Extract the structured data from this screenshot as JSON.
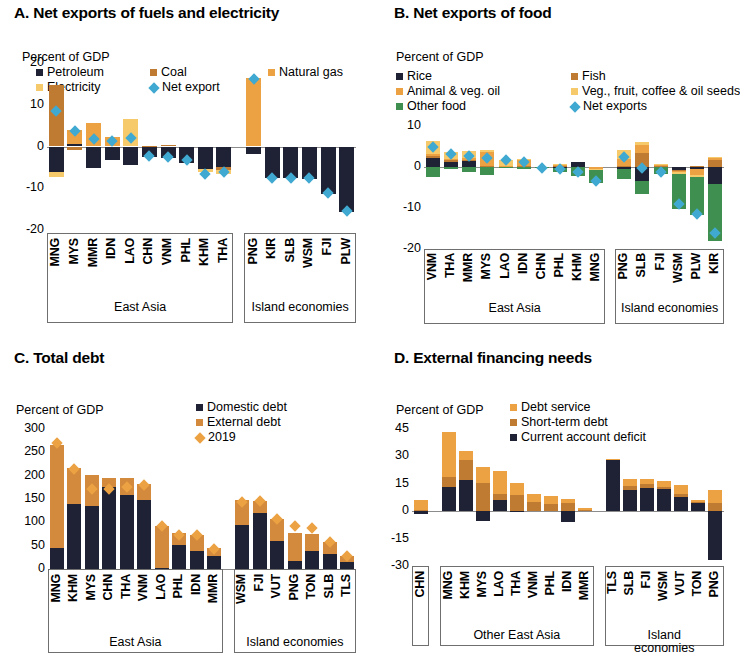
{
  "figure": {
    "background": "#ffffff",
    "colors": {
      "petroleum": "#1f2235",
      "coal": "#c07b33",
      "natural_gas": "#eca243",
      "electricity": "#f6c96a",
      "net_export": "#3fa9d1",
      "rice": "#1f2235",
      "fish": "#c07b33",
      "animal_veg_oil": "#eca243",
      "veg_fruit_coffee": "#f6c96a",
      "other_food": "#3f9050",
      "domestic_debt": "#1f2235",
      "external_debt": "#d38a3c",
      "year_2019": "#eca243",
      "debt_service": "#eca243",
      "short_term_debt": "#c07b33",
      "current_account_deficit": "#1f2235",
      "axis": "#8c8c8c"
    }
  },
  "panels": {
    "a": {
      "title": "A. Net exports of fuels and electricity",
      "unit": "Percent of GDP",
      "legend": [
        {
          "label": "Petroleum",
          "color": "#1f2235",
          "marker": "square"
        },
        {
          "label": "Coal",
          "color": "#c07b33",
          "marker": "square"
        },
        {
          "label": "Natural gas",
          "color": "#eca243",
          "marker": "square"
        },
        {
          "label": "Electricity",
          "color": "#f6c96a",
          "marker": "square"
        },
        {
          "label": "Net export",
          "color": "#3fa9d1",
          "marker": "diamond"
        }
      ],
      "groups": [
        {
          "label": "East Asia",
          "count": 10
        },
        {
          "label": "Island economies",
          "count": 6
        }
      ]
    },
    "b": {
      "title": "B. Net exports of food",
      "unit": "Percent of GDP",
      "legend": [
        {
          "label": "Rice",
          "color": "#1f2235",
          "marker": "square"
        },
        {
          "label": "Fish",
          "color": "#c07b33",
          "marker": "square"
        },
        {
          "label": "Animal & veg. oil",
          "color": "#eca243",
          "marker": "square"
        },
        {
          "label": "Veg., fruit, coffee & oil seeds",
          "color": "#f6c96a",
          "marker": "square"
        },
        {
          "label": "Other food",
          "color": "#3f9050",
          "marker": "square"
        },
        {
          "label": "Net exports",
          "color": "#3fa9d1",
          "marker": "diamond"
        }
      ],
      "groups": [
        {
          "label": "East Asia",
          "count": 10
        },
        {
          "label": "Island economies",
          "count": 6
        }
      ]
    },
    "c": {
      "title": "C. Total debt",
      "unit": "Percent of GDP",
      "legend": [
        {
          "label": "Domestic debt",
          "color": "#1f2235",
          "marker": "square"
        },
        {
          "label": "External debt",
          "color": "#d38a3c",
          "marker": "square"
        },
        {
          "label": "2019",
          "color": "#eca243",
          "marker": "diamond"
        }
      ],
      "groups": [
        {
          "label": "East Asia",
          "count": 10
        },
        {
          "label": "Island economies",
          "count": 7
        }
      ]
    },
    "d": {
      "title": "D. External financing needs",
      "unit": "Percent of GDP",
      "legend": [
        {
          "label": "Debt service",
          "color": "#eca243",
          "marker": "square"
        },
        {
          "label": "Short-term debt",
          "color": "#c07b33",
          "marker": "square"
        },
        {
          "label": "Current account deficit",
          "color": "#1f2235",
          "marker": "square"
        }
      ],
      "groups": [
        {
          "label": "",
          "count": 1
        },
        {
          "label": "Other East Asia",
          "count": 9
        },
        {
          "label": "Island economies",
          "count": 7
        }
      ]
    }
  },
  "chart_data": [
    {
      "panel": "A",
      "type": "bar",
      "title": "A. Net exports of fuels and electricity",
      "subtitle": "Percent of GDP",
      "ylabel": "Percent of GDP",
      "xlabel": "",
      "ylim": [
        -20,
        20
      ],
      "yticks": [
        -20,
        -10,
        0,
        10,
        20
      ],
      "grid": false,
      "stacked": true,
      "legend_position": "top",
      "categories": [
        "MNG",
        "MYS",
        "MMR",
        "IDN",
        "LAO",
        "CHN",
        "VNM",
        "PHL",
        "KHM",
        "THA",
        "PNG",
        "KIR",
        "SLB",
        "WSM",
        "FJI",
        "PLW"
      ],
      "series": [
        {
          "name": "Petroleum",
          "color": "#1f2235",
          "values": [
            -6.2,
            0.6,
            -5.2,
            -3.2,
            -4.5,
            -2.6,
            -2.8,
            -3.9,
            -5.3,
            -5.0,
            -1.8,
            -7.6,
            -7.6,
            -7.7,
            -11.3,
            -15.6
          ]
        },
        {
          "name": "Coal",
          "color": "#c07b33",
          "values": [
            14.8,
            -0.9,
            0.0,
            0.0,
            0.0,
            0.1,
            0.4,
            0.0,
            0.0,
            -0.7,
            0.0,
            0.0,
            0.0,
            0.0,
            0.0,
            0.0
          ]
        },
        {
          "name": "Natural gas",
          "color": "#eca243",
          "values": [
            0.0,
            3.4,
            5.6,
            2.3,
            0.0,
            0.0,
            0.0,
            0.0,
            0.0,
            0.0,
            16.4,
            0.0,
            0.0,
            0.0,
            0.0,
            0.0
          ]
        },
        {
          "name": "Electricity",
          "color": "#f6c96a",
          "values": [
            -1.2,
            0.0,
            0.0,
            0.0,
            6.6,
            0.0,
            0.0,
            0.0,
            -0.9,
            -0.8,
            0.0,
            0.0,
            0.0,
            0.0,
            0.0,
            0.0
          ]
        }
      ],
      "marker_series": {
        "name": "Net export",
        "color": "#3fa9d1",
        "type": "diamond",
        "values": [
          8.5,
          3.8,
          1.9,
          1.4,
          2.1,
          -2.3,
          -2.4,
          -3.3,
          -6.7,
          -6.1,
          16.2,
          -7.6,
          -7.5,
          -7.6,
          -11.1,
          -15.4
        ]
      }
    },
    {
      "panel": "B",
      "type": "bar",
      "title": "B. Net exports of food",
      "subtitle": "Percent of GDP",
      "ylabel": "Percent of GDP",
      "xlabel": "",
      "ylim": [
        -20,
        10
      ],
      "yticks": [
        -20,
        -10,
        0,
        10
      ],
      "grid": false,
      "stacked": true,
      "legend_position": "top",
      "categories": [
        "VNM",
        "THA",
        "MMR",
        "MYS",
        "LAO",
        "IDN",
        "CHN",
        "PHL",
        "KHM",
        "MNG",
        "PNG",
        "SLB",
        "FJI",
        "WSM",
        "PLW",
        "KIR"
      ],
      "series": [
        {
          "name": "Rice",
          "color": "#1f2235",
          "values": [
            2.1,
            1.3,
            1.5,
            0.0,
            0.0,
            0.0,
            0.0,
            -0.2,
            1.2,
            0.0,
            -0.6,
            -3.4,
            0.0,
            -0.8,
            -0.5,
            -4.2
          ]
        },
        {
          "name": "Fish",
          "color": "#c07b33",
          "values": [
            0.7,
            0.3,
            0.3,
            0.2,
            0.0,
            0.2,
            0.1,
            0.2,
            0.0,
            0.0,
            0.2,
            3.4,
            0.2,
            -0.1,
            0.2,
            1.6
          ]
        },
        {
          "name": "Animal & veg. oil",
          "color": "#eca243",
          "values": [
            0.4,
            0.4,
            0.3,
            3.4,
            0.2,
            1.4,
            0.0,
            0.3,
            0.0,
            -0.4,
            1.8,
            2.0,
            0.2,
            -0.4,
            -1.5,
            0.6
          ]
        },
        {
          "name": "Veg., fruit, coffee & oil seeds",
          "color": "#f6c96a",
          "values": [
            3.1,
            1.6,
            1.8,
            0.5,
            1.5,
            0.4,
            0.0,
            0.2,
            0.0,
            -0.3,
            2.2,
            0.8,
            0.3,
            -0.3,
            -0.4,
            0.3
          ]
        },
        {
          "name": "Other food",
          "color": "#3f9050",
          "values": [
            -2.5,
            -0.6,
            -1.1,
            -2.0,
            -0.2,
            -0.5,
            -0.3,
            -1.1,
            -2.3,
            -3.2,
            -2.4,
            -3.1,
            -1.6,
            -8.6,
            -9.3,
            -13.8
          ]
        }
      ],
      "marker_series": {
        "name": "Net exports",
        "color": "#3fa9d1",
        "type": "diamond",
        "values": [
          5.0,
          3.1,
          2.8,
          2.1,
          1.6,
          1.2,
          -0.2,
          -0.6,
          -1.1,
          -3.5,
          2.5,
          -0.2,
          -1.2,
          -9.1,
          -11.5,
          -16.0
        ]
      }
    },
    {
      "panel": "C",
      "type": "bar",
      "title": "C. Total debt",
      "subtitle": "Percent of GDP",
      "ylabel": "Percent of GDP",
      "xlabel": "",
      "ylim": [
        0,
        300
      ],
      "yticks": [
        0,
        50,
        100,
        150,
        200,
        250,
        300
      ],
      "grid": false,
      "stacked": true,
      "legend_position": "top-right",
      "categories": [
        "MNG",
        "KHM",
        "MYS",
        "CHN",
        "THA",
        "VNM",
        "LAO",
        "PHL",
        "IDN",
        "MMR",
        "WSM",
        "FJI",
        "VUT",
        "PNG",
        "TON",
        "SLB",
        "TLS"
      ],
      "series": [
        {
          "name": "Domestic debt",
          "color": "#1f2235",
          "values": [
            46,
            140,
            134,
            176,
            158,
            147,
            2,
            52,
            38,
            28,
            94,
            121,
            61,
            18,
            39,
            32,
            16
          ]
        },
        {
          "name": "External debt",
          "color": "#d38a3c",
          "values": [
            219,
            76,
            67,
            20,
            38,
            35,
            91,
            26,
            35,
            18,
            54,
            25,
            46,
            60,
            37,
            25,
            12
          ]
        }
      ],
      "marker_series": {
        "name": "2019",
        "color": "#eca243",
        "type": "diamond",
        "values": [
          270,
          214,
          171,
          172,
          176,
          180,
          93,
          73,
          73,
          43,
          143,
          146,
          107,
          92,
          87,
          58,
          27
        ]
      }
    },
    {
      "panel": "D",
      "type": "bar",
      "title": "D. External financing needs",
      "subtitle": "Percent of GDP",
      "ylabel": "Percent of GDP",
      "xlabel": "",
      "ylim": [
        -30,
        45
      ],
      "yticks": [
        -30,
        -15,
        0,
        15,
        30,
        45
      ],
      "grid": false,
      "stacked": true,
      "legend_position": "top-right",
      "categories": [
        "CHN",
        "MNG",
        "KHM",
        "MYS",
        "LAO",
        "THA",
        "VNM",
        "PHL",
        "IDN",
        "MMR",
        "TLS",
        "SLB",
        "FJI",
        "WSM",
        "VUT",
        "TON",
        "PNG"
      ],
      "series": [
        {
          "name": "Current account deficit",
          "color": "#1f2235",
          "values": [
            -1.5,
            13.2,
            17.3,
            -5.2,
            6.0,
            -0.4,
            0.0,
            0.0,
            -5.8,
            0.0,
            28.4,
            11.6,
            12.5,
            12.2,
            7.6,
            4.3,
            -26.5
          ]
        },
        {
          "name": "Short-term debt",
          "color": "#c07b33",
          "values": [
            0.6,
            5.4,
            10.6,
            15.3,
            3.4,
            9.0,
            4.8,
            4.0,
            4.3,
            0.6,
            0.2,
            2.4,
            2.2,
            1.0,
            1.6,
            0.6,
            4.3
          ]
        },
        {
          "name": "Debt service",
          "color": "#eca243",
          "values": [
            5.7,
            24.5,
            5.1,
            8.8,
            12.6,
            6.6,
            4.5,
            4.4,
            2.5,
            0.9,
            0.2,
            3.4,
            2.9,
            3.6,
            5.0,
            1.4,
            7.5
          ]
        }
      ]
    }
  ]
}
